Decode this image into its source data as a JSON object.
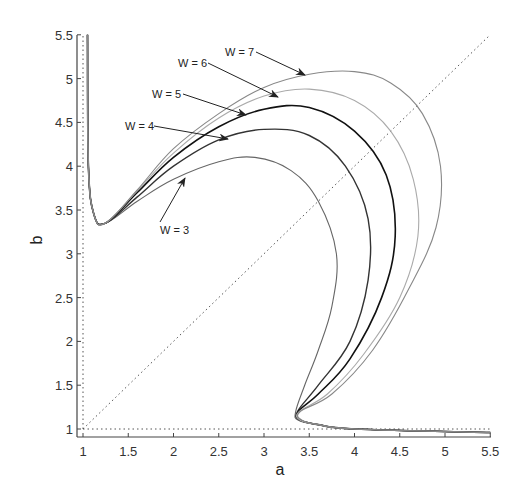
{
  "chart_data": {
    "type": "line",
    "title": "",
    "xlabel": "a",
    "ylabel": "b",
    "xlim": [
      1,
      5.5
    ],
    "ylim": [
      1,
      5.5
    ],
    "grid": false,
    "legend": "none (inline arrow annotations)",
    "x_ticks": [
      "1",
      "1.5",
      "2",
      "2.5",
      "3",
      "3.5",
      "4",
      "4.5",
      "5",
      "5.5"
    ],
    "y_ticks": [
      "1",
      "1.5",
      "2",
      "2.5",
      "3",
      "3.5",
      "4",
      "4.5",
      "5",
      "5.5"
    ],
    "reference_lines": [
      {
        "name": "diagonal a=b",
        "style": "dotted",
        "from": [
          1,
          1
        ],
        "to": [
          5.5,
          5.5
        ]
      },
      {
        "name": "a=1",
        "style": "dotted",
        "from": [
          1,
          1
        ],
        "to": [
          1,
          5.5
        ]
      },
      {
        "name": "b=1",
        "style": "dotted",
        "from": [
          1,
          1
        ],
        "to": [
          5.5,
          1
        ]
      }
    ],
    "series": [
      {
        "name": "W = 3",
        "points": [
          [
            1.05,
            5.5
          ],
          [
            1.06,
            4.0
          ],
          [
            1.12,
            3.45
          ],
          [
            1.25,
            3.35
          ],
          [
            1.6,
            3.6
          ],
          [
            2.0,
            3.85
          ],
          [
            2.5,
            4.05
          ],
          [
            2.9,
            4.1
          ],
          [
            3.3,
            3.95
          ],
          [
            3.6,
            3.6
          ],
          [
            3.8,
            3.0
          ],
          [
            3.75,
            2.4
          ],
          [
            3.6,
            1.9
          ],
          [
            3.45,
            1.5
          ],
          [
            3.35,
            1.2
          ],
          [
            3.38,
            1.1
          ],
          [
            3.6,
            1.05
          ],
          [
            4.0,
            1.0
          ],
          [
            5.5,
            0.96
          ]
        ]
      },
      {
        "name": "W = 4",
        "points": [
          [
            1.05,
            5.5
          ],
          [
            1.06,
            4.0
          ],
          [
            1.12,
            3.45
          ],
          [
            1.25,
            3.35
          ],
          [
            1.6,
            3.65
          ],
          [
            2.0,
            4.0
          ],
          [
            2.5,
            4.3
          ],
          [
            3.0,
            4.42
          ],
          [
            3.5,
            4.35
          ],
          [
            3.9,
            4.0
          ],
          [
            4.15,
            3.4
          ],
          [
            4.15,
            2.7
          ],
          [
            3.95,
            2.0
          ],
          [
            3.6,
            1.5
          ],
          [
            3.37,
            1.2
          ],
          [
            3.4,
            1.1
          ],
          [
            3.6,
            1.05
          ],
          [
            4.0,
            1.0
          ],
          [
            5.5,
            0.96
          ]
        ]
      },
      {
        "name": "W = 5",
        "points": [
          [
            1.05,
            5.5
          ],
          [
            1.06,
            4.0
          ],
          [
            1.12,
            3.45
          ],
          [
            1.25,
            3.35
          ],
          [
            1.6,
            3.7
          ],
          [
            2.0,
            4.1
          ],
          [
            2.5,
            4.45
          ],
          [
            3.0,
            4.65
          ],
          [
            3.5,
            4.67
          ],
          [
            4.0,
            4.4
          ],
          [
            4.35,
            3.9
          ],
          [
            4.45,
            3.2
          ],
          [
            4.3,
            2.5
          ],
          [
            3.95,
            1.8
          ],
          [
            3.6,
            1.4
          ],
          [
            3.38,
            1.2
          ],
          [
            3.4,
            1.1
          ],
          [
            3.6,
            1.05
          ],
          [
            4.0,
            1.0
          ],
          [
            5.5,
            0.96
          ]
        ]
      },
      {
        "name": "W = 6",
        "points": [
          [
            1.05,
            5.5
          ],
          [
            1.06,
            4.0
          ],
          [
            1.12,
            3.45
          ],
          [
            1.25,
            3.35
          ],
          [
            1.6,
            3.72
          ],
          [
            2.0,
            4.15
          ],
          [
            2.5,
            4.55
          ],
          [
            3.0,
            4.8
          ],
          [
            3.5,
            4.88
          ],
          [
            4.0,
            4.75
          ],
          [
            4.4,
            4.4
          ],
          [
            4.65,
            3.85
          ],
          [
            4.7,
            3.2
          ],
          [
            4.5,
            2.5
          ],
          [
            4.1,
            1.85
          ],
          [
            3.7,
            1.4
          ],
          [
            3.39,
            1.2
          ],
          [
            3.4,
            1.1
          ],
          [
            3.6,
            1.05
          ],
          [
            4.0,
            1.0
          ],
          [
            5.5,
            0.96
          ]
        ]
      },
      {
        "name": "W = 7",
        "points": [
          [
            1.05,
            5.5
          ],
          [
            1.06,
            4.0
          ],
          [
            1.12,
            3.45
          ],
          [
            1.25,
            3.35
          ],
          [
            1.6,
            3.73
          ],
          [
            2.0,
            4.2
          ],
          [
            2.5,
            4.6
          ],
          [
            3.0,
            4.9
          ],
          [
            3.5,
            5.05
          ],
          [
            4.0,
            5.08
          ],
          [
            4.4,
            4.95
          ],
          [
            4.75,
            4.6
          ],
          [
            4.95,
            4.0
          ],
          [
            4.9,
            3.3
          ],
          [
            4.6,
            2.6
          ],
          [
            4.2,
            1.9
          ],
          [
            3.75,
            1.4
          ],
          [
            3.4,
            1.2
          ],
          [
            3.42,
            1.1
          ],
          [
            3.6,
            1.05
          ],
          [
            4.0,
            1.0
          ],
          [
            5.5,
            0.96
          ]
        ]
      }
    ],
    "annotations": [
      {
        "text": "W = 7",
        "arrow_to": [
          3.45,
          5.05
        ]
      },
      {
        "text": "W = 6",
        "arrow_to": [
          3.2,
          4.8
        ]
      },
      {
        "text": "W = 5",
        "arrow_to": [
          2.8,
          4.55
        ]
      },
      {
        "text": "W = 4",
        "arrow_to": [
          2.6,
          4.35
        ]
      },
      {
        "text": "W = 3",
        "arrow_to": [
          2.15,
          3.85
        ]
      }
    ]
  },
  "labels": {
    "xlabel": "a",
    "ylabel": "b",
    "x_ticks": [
      "1",
      "1.5",
      "2",
      "2.5",
      "3",
      "3.5",
      "4",
      "4.5",
      "5",
      "5.5"
    ],
    "y_ticks": [
      "1",
      "1.5",
      "2",
      "2.5",
      "3",
      "3.5",
      "4",
      "4.5",
      "5",
      "5.5"
    ],
    "ann": [
      "W = 7",
      "W = 6",
      "W = 5",
      "W = 4",
      "W = 3"
    ]
  }
}
